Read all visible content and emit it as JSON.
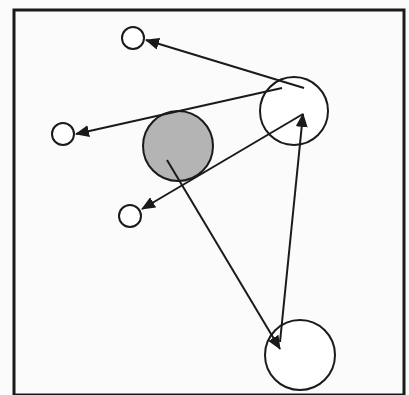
{
  "diagram": {
    "width": 409,
    "height": 395,
    "colors": {
      "background": "#fbfbfb",
      "stroke": "#1a1a1a",
      "node_fill": "#ffffff",
      "highlight_fill": "#b4b4b4"
    },
    "frame": {
      "x": 14,
      "y": 10,
      "width": 390,
      "height": 385,
      "stroke_width": 3
    },
    "nodes": [
      {
        "id": "small-top",
        "cx": 133,
        "cy": 38,
        "r": 11,
        "filled": false
      },
      {
        "id": "small-left",
        "cx": 63,
        "cy": 134,
        "r": 11,
        "filled": false
      },
      {
        "id": "small-lower",
        "cx": 130,
        "cy": 216,
        "r": 11,
        "filled": false
      },
      {
        "id": "gray-center",
        "cx": 178,
        "cy": 146,
        "r": 35,
        "filled": true
      },
      {
        "id": "large-upper-right",
        "cx": 294,
        "cy": 111,
        "r": 34,
        "filled": false
      },
      {
        "id": "large-bottom",
        "cx": 300,
        "cy": 355,
        "r": 35,
        "filled": false
      }
    ],
    "edges": [
      {
        "id": "edge-upper-right-to-top",
        "from": "large-upper-right",
        "to": "small-top",
        "x1": 304,
        "y1": 88,
        "x2": 146,
        "y2": 40
      },
      {
        "id": "edge-upper-right-to-left",
        "from": "large-upper-right",
        "to": "small-left",
        "x1": 282,
        "y1": 88,
        "x2": 76,
        "y2": 134
      },
      {
        "id": "edge-upper-right-to-lower",
        "from": "large-upper-right",
        "to": "small-lower",
        "x1": 303,
        "y1": 114,
        "x2": 142,
        "y2": 209
      },
      {
        "id": "edge-gray-to-bottom",
        "from": "gray-center",
        "to": "large-bottom",
        "x1": 167,
        "y1": 160,
        "x2": 280,
        "y2": 349
      },
      {
        "id": "edge-bottom-to-upper-right",
        "from": "large-bottom",
        "to": "large-upper-right",
        "x1": 280,
        "y1": 342,
        "x2": 303,
        "y2": 114
      }
    ]
  }
}
